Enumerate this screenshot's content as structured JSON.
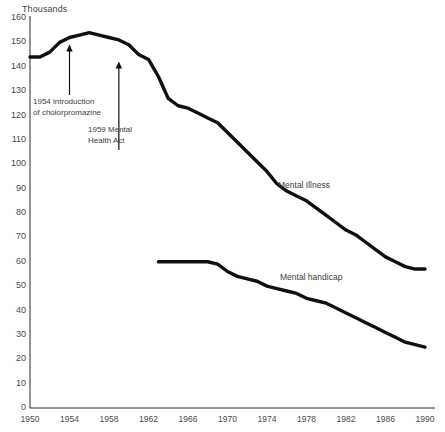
{
  "chart_data": {
    "type": "line",
    "title": "",
    "subtitle": "",
    "unit_label": "Thousands",
    "xlabel": "",
    "ylabel": "Thousands",
    "xlim": [
      1950,
      1990
    ],
    "ylim": [
      0,
      160
    ],
    "grid": false,
    "legend_position": "inline-labels",
    "x_ticks": [
      1950,
      1954,
      1958,
      1962,
      1966,
      1970,
      1974,
      1978,
      1982,
      1986,
      1990
    ],
    "y_ticks": [
      0,
      10,
      20,
      30,
      40,
      50,
      60,
      70,
      80,
      90,
      100,
      110,
      120,
      130,
      140,
      150,
      160
    ],
    "series": [
      {
        "name": "Mental Illness",
        "x": [
          1950,
          1951,
          1952,
          1953,
          1954,
          1955,
          1956,
          1957,
          1958,
          1959,
          1960,
          1961,
          1962,
          1963,
          1964,
          1965,
          1966,
          1967,
          1968,
          1969,
          1970,
          1971,
          1972,
          1973,
          1974,
          1975,
          1976,
          1977,
          1978,
          1979,
          1980,
          1981,
          1982,
          1983,
          1984,
          1985,
          1986,
          1987,
          1988,
          1989,
          1990
        ],
        "values": [
          144,
          144,
          146,
          150,
          152,
          153,
          154,
          153,
          152,
          151,
          149,
          145,
          143,
          136,
          127,
          124,
          123,
          121,
          119,
          117,
          113,
          109,
          105,
          101,
          97,
          92,
          89,
          87,
          85,
          82,
          79,
          76,
          73,
          71,
          68,
          65,
          62,
          60,
          58,
          57,
          57
        ]
      },
      {
        "name": "Mental handicap",
        "x": [
          1963,
          1964,
          1965,
          1966,
          1967,
          1968,
          1969,
          1970,
          1971,
          1972,
          1973,
          1974,
          1975,
          1976,
          1977,
          1978,
          1979,
          1980,
          1981,
          1982,
          1983,
          1984,
          1985,
          1986,
          1987,
          1988,
          1989,
          1990
        ],
        "values": [
          60,
          60,
          60,
          60,
          60,
          60,
          59,
          56,
          54,
          53,
          52,
          50,
          49,
          48,
          47,
          45,
          44,
          43,
          41,
          39,
          37,
          35,
          33,
          31,
          29,
          27,
          26,
          25
        ]
      }
    ],
    "annotations": [
      {
        "id": "chlorpromazine",
        "lines": [
          "1954 introduction",
          "of cholorpromazine"
        ],
        "points_to_year": 1954,
        "points_to_value": 152
      },
      {
        "id": "mental-health-act",
        "lines": [
          "1959 Mental",
          "Health Act"
        ],
        "points_to_year": 1959,
        "points_to_value": 145
      }
    ]
  }
}
